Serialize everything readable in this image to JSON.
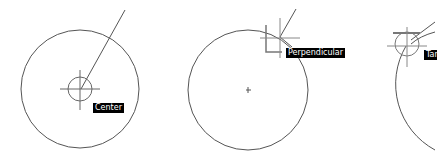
{
  "panels": [
    {
      "snap": "center",
      "tooltip": "Center"
    },
    {
      "snap": "perpendicular",
      "tooltip": "Perpendicular"
    },
    {
      "snap": "tangent",
      "tooltip": "Tan"
    }
  ],
  "colors": {
    "background": "#ffffff",
    "line": "#555555",
    "marker": "#777777",
    "tooltip_bg": "#000000",
    "tooltip_fg": "#ffffff"
  }
}
